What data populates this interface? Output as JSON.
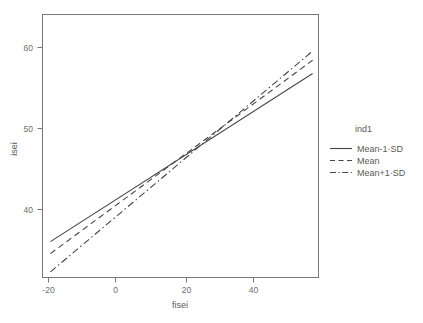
{
  "chart_data": {
    "type": "line",
    "title": "",
    "xlabel": "fisei",
    "ylabel": "isei",
    "xlim": [
      -22.5,
      57.5
    ],
    "ylim": [
      31.2,
      68.6
    ],
    "xticks": [
      -20,
      0,
      20,
      40
    ],
    "yticks": [
      40,
      50,
      60
    ],
    "xtick_labels": [
      "-20",
      "0",
      "20",
      "40"
    ],
    "ytick_labels": [
      "40",
      "50",
      "60"
    ],
    "grid": false,
    "legend_position": "right",
    "series": [
      {
        "name": "Mean-1·SD",
        "style": "solid",
        "x": [
          -20.2,
          55.8
        ],
        "y": [
          36.3,
          60.2
        ],
        "slope": 0.3145,
        "intercept": 42.65
      },
      {
        "name": "Mean",
        "style": "dashed",
        "x": [
          -20.2,
          55.8
        ],
        "y": [
          34.6,
          62.1
        ],
        "slope": 0.3618,
        "intercept": 41.91
      },
      {
        "name": "Mean+1·SD",
        "style": "dashdot",
        "x": [
          -20.2,
          55.8
        ],
        "y": [
          32.0,
          63.4
        ],
        "slope": 0.4132,
        "intercept": 40.35
      }
    ]
  },
  "legend": {
    "title": "ind1",
    "entries": [
      {
        "label": "Mean-1·SD",
        "style": "solid"
      },
      {
        "label": "Mean",
        "style": "dashed"
      },
      {
        "label": "Mean+1·SD",
        "style": "dashdot"
      }
    ]
  },
  "axes": {
    "x_title": "fisei",
    "y_title": "isei"
  },
  "colors": {
    "line": "#444444",
    "frame": "#777777",
    "text": "#5a5a5a",
    "background": "#ffffff"
  }
}
